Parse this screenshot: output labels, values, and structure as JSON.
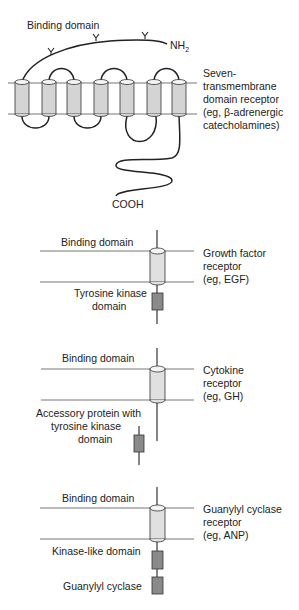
{
  "seven_tm": {
    "binding_label": "Binding domain",
    "nh2_label": "NH",
    "nh2_sub": "2",
    "cooh_label": "COOH",
    "desc": [
      "Seven-",
      "transmembrane",
      "domain receptor",
      "(eg, β-adrenergic",
      "catecholamines)"
    ]
  },
  "growth_factor": {
    "binding_label": "Binding domain",
    "desc": [
      "Growth factor",
      "receptor",
      "(eg, EGF)"
    ],
    "kinase_label": [
      "Tyrosine kinase",
      "domain"
    ]
  },
  "cytokine": {
    "binding_label": "Binding domain",
    "desc": [
      "Cytokine",
      "receptor",
      "(eg, GH)"
    ],
    "accessory_label": [
      "Accessory protein with",
      "tyrosine kinase",
      "domain"
    ]
  },
  "guanylyl": {
    "binding_label": "Binding domain",
    "desc": [
      "Guanylyl cyclase",
      "receptor",
      "(eg, ANP)"
    ],
    "kinase_like_label": "Kinase-like domain",
    "cyclase_label": "Guanylyl cyclase"
  }
}
